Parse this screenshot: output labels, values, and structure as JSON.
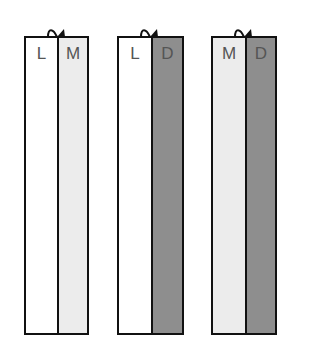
{
  "colors": {
    "L": "#ffffff",
    "M": "#ececec",
    "D": "#8e8e8e",
    "outline": "#111111",
    "label_text": "#555555"
  },
  "pairs": [
    {
      "left": {
        "label": "L",
        "shade": "light"
      },
      "right": {
        "label": "M",
        "shade": "medium"
      }
    },
    {
      "left": {
        "label": "L",
        "shade": "light"
      },
      "right": {
        "label": "D",
        "shade": "dark"
      }
    },
    {
      "left": {
        "label": "M",
        "shade": "medium"
      },
      "right": {
        "label": "D",
        "shade": "dark"
      }
    }
  ]
}
